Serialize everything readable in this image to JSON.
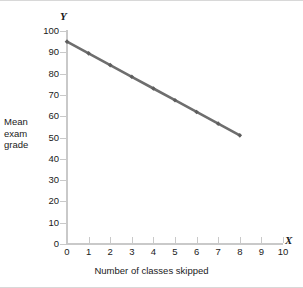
{
  "figure": {
    "y_axis_letter": "Y",
    "x_axis_letter": "X",
    "y_axis_title_lines": [
      "Mean",
      "exam",
      "grade"
    ],
    "x_axis_title": "Number of classes skipped"
  },
  "colors": {
    "line": "#6e6e6e",
    "marker": "#5e5e5e",
    "axis": "#c9c9c9",
    "text": "#1a1a1a",
    "frame": "#d8d8d8",
    "background": "#ffffff"
  },
  "chart_data": {
    "type": "line",
    "title": "",
    "xlabel": "Number of classes skipped",
    "ylabel": "Mean exam grade",
    "xlim": [
      0,
      10
    ],
    "ylim": [
      0,
      100
    ],
    "xticks": [
      0,
      1,
      2,
      3,
      4,
      5,
      6,
      7,
      8,
      9,
      10
    ],
    "yticks": [
      0,
      10,
      20,
      30,
      40,
      50,
      60,
      70,
      80,
      90,
      100
    ],
    "xtick_labels": [
      "0",
      "1",
      "2",
      "3",
      "4",
      "5",
      "6",
      "7",
      "8",
      "9",
      "10"
    ],
    "ytick_labels": [
      "0",
      "10",
      "20",
      "30",
      "40",
      "50",
      "60",
      "70",
      "80",
      "90",
      "100"
    ],
    "grid": false,
    "legend": null,
    "markers": true,
    "x": [
      0,
      1,
      2,
      3,
      4,
      5,
      6,
      7,
      8
    ],
    "values": [
      95,
      89.5,
      84,
      78.5,
      73,
      67.5,
      62,
      56.5,
      51
    ],
    "series": [
      {
        "name": "Mean exam grade",
        "x": [
          0,
          1,
          2,
          3,
          4,
          5,
          6,
          7,
          8
        ],
        "values": [
          95,
          89.5,
          84,
          78.5,
          73,
          67.5,
          62,
          56.5,
          51
        ]
      }
    ],
    "slope": -5.5,
    "intercept": 95
  }
}
